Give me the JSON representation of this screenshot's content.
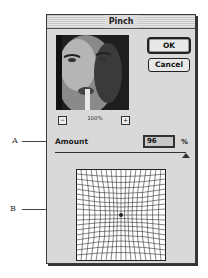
{
  "dialog": {
    "title": "Pinch",
    "buttons": {
      "ok": "OK",
      "cancel": "Cancel"
    },
    "preview": {
      "zoom_level": "100%",
      "zoom_out_icon": "minus-icon",
      "zoom_in_icon": "plus-icon"
    },
    "amount": {
      "label": "Amount",
      "value": "96",
      "unit": "%"
    },
    "slider": {
      "value_percent": 96
    }
  },
  "callouts": {
    "a": "A",
    "b": "B"
  },
  "colors": {
    "dialog_bg": "#d9d9d9",
    "border": "#222222"
  }
}
